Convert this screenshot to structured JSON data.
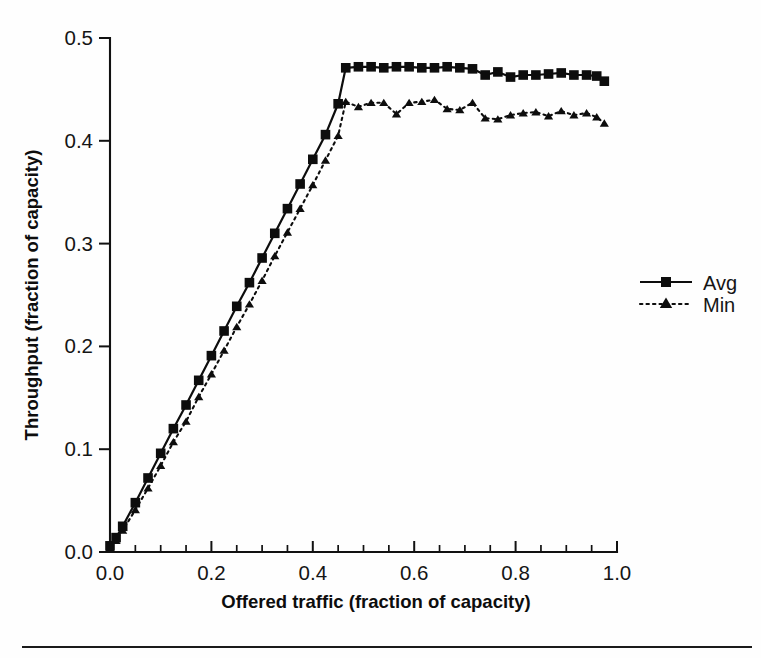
{
  "figure": {
    "background_color": "#fefefe",
    "ink_color": "#0d0d0d",
    "has_bottom_rule": true
  },
  "chart_data": {
    "type": "line",
    "title": "",
    "subtitle": "",
    "xlabel": "Offered traffic (fraction of capacity)",
    "ylabel": "Throughput (fraction of capacity)",
    "xlim": [
      0.0,
      1.0
    ],
    "ylim": [
      0.0,
      0.5
    ],
    "grid": false,
    "legend_position": "right",
    "x_major_ticks": [
      0.0,
      0.2,
      0.4,
      0.6,
      0.8,
      1.0
    ],
    "x_major_tick_labels": [
      "0.0",
      "0.2",
      "0.4",
      "0.6",
      "0.8",
      "1.0"
    ],
    "x_minor_tick_interval": 0.05,
    "y_major_ticks": [
      0.0,
      0.1,
      0.2,
      0.3,
      0.4,
      0.5
    ],
    "y_major_tick_labels": [
      "0.0",
      "0.1",
      "0.2",
      "0.3",
      "0.4",
      "0.5"
    ],
    "x": [
      0.0,
      0.012,
      0.025,
      0.05,
      0.075,
      0.1,
      0.125,
      0.15,
      0.175,
      0.2,
      0.225,
      0.25,
      0.275,
      0.3,
      0.325,
      0.35,
      0.375,
      0.4,
      0.425,
      0.45,
      0.465,
      0.49,
      0.515,
      0.54,
      0.565,
      0.59,
      0.615,
      0.64,
      0.665,
      0.69,
      0.715,
      0.74,
      0.765,
      0.79,
      0.815,
      0.84,
      0.865,
      0.89,
      0.915,
      0.94,
      0.96,
      0.975
    ],
    "series": [
      {
        "name": "Avg",
        "marker": "square",
        "linestyle": "solid",
        "color": "#0d0d0d",
        "values": [
          0.006,
          0.014,
          0.025,
          0.048,
          0.072,
          0.096,
          0.12,
          0.143,
          0.167,
          0.191,
          0.215,
          0.239,
          0.262,
          0.286,
          0.31,
          0.334,
          0.358,
          0.382,
          0.406,
          0.436,
          0.471,
          0.472,
          0.472,
          0.471,
          0.472,
          0.472,
          0.471,
          0.471,
          0.472,
          0.471,
          0.47,
          0.464,
          0.467,
          0.462,
          0.464,
          0.464,
          0.465,
          0.466,
          0.464,
          0.464,
          0.463,
          0.458
        ]
      },
      {
        "name": "Min",
        "marker": "triangle",
        "linestyle": "dotted",
        "color": "#0d0d0d",
        "values": [
          0.004,
          0.011,
          0.021,
          0.041,
          0.062,
          0.084,
          0.107,
          0.127,
          0.151,
          0.173,
          0.196,
          0.219,
          0.241,
          0.264,
          0.288,
          0.311,
          0.334,
          0.357,
          0.381,
          0.405,
          0.438,
          0.433,
          0.437,
          0.437,
          0.426,
          0.437,
          0.438,
          0.44,
          0.431,
          0.43,
          0.437,
          0.422,
          0.421,
          0.425,
          0.427,
          0.428,
          0.424,
          0.429,
          0.425,
          0.427,
          0.423,
          0.417
        ]
      }
    ],
    "legend": [
      {
        "label": "Avg",
        "marker": "square",
        "linestyle": "solid"
      },
      {
        "label": "Min",
        "marker": "triangle",
        "linestyle": "dotted"
      }
    ]
  }
}
